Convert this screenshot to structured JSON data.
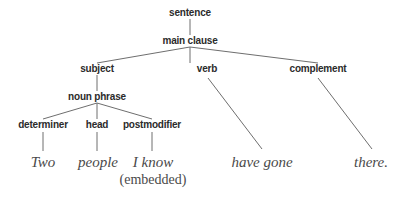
{
  "diagram": {
    "type": "syntax-tree",
    "colors": {
      "edge": "#6e6e6e",
      "node_text": "#2b2b2b",
      "word_text": "#4a4a4a",
      "background": "#ffffff"
    },
    "nodes": {
      "sentence": "sentence",
      "main_clause": "main clause",
      "subject": "subject",
      "verb": "verb",
      "complement": "complement",
      "noun_phrase": "noun phrase",
      "determiner": "determiner",
      "head": "head",
      "postmodifier": "postmodifier"
    },
    "words": {
      "two": "Two",
      "people": "people",
      "i_know": "I know",
      "embedded_note": "(embedded)",
      "have_gone": "have gone",
      "there": "there."
    },
    "edges": [
      [
        "sentence",
        "main clause"
      ],
      [
        "main clause",
        "subject"
      ],
      [
        "main clause",
        "verb"
      ],
      [
        "main clause",
        "complement"
      ],
      [
        "subject",
        "noun phrase"
      ],
      [
        "noun phrase",
        "determiner"
      ],
      [
        "noun phrase",
        "head"
      ],
      [
        "noun phrase",
        "postmodifier"
      ],
      [
        "determiner",
        "Two"
      ],
      [
        "head",
        "people"
      ],
      [
        "postmodifier",
        "I know"
      ],
      [
        "verb",
        "have gone"
      ],
      [
        "complement",
        "there."
      ]
    ]
  }
}
